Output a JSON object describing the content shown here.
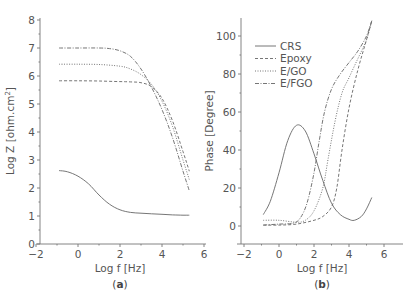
{
  "figure": {
    "panels": [
      {
        "id": "a",
        "label": "(a)",
        "bold_letter": "a"
      },
      {
        "id": "b",
        "label": "(b)",
        "bold_letter": "b"
      }
    ]
  },
  "chart_data": [
    {
      "type": "line",
      "panel": "(a)",
      "title": "",
      "xlabel": "Log f [Hz]",
      "ylabel": "Log Z [ohm.cm²]",
      "xlim": [
        -2,
        6
      ],
      "ylim": [
        0,
        8
      ],
      "xticks": [
        -2,
        0,
        2,
        4,
        6
      ],
      "yticks": [
        0,
        1,
        2,
        3,
        4,
        5,
        6,
        7,
        8
      ],
      "grid": false,
      "series": [
        {
          "name": "CRS",
          "style": "solid",
          "x": [
            -0.9,
            -0.5,
            0,
            0.5,
            1,
            1.5,
            2,
            2.5,
            3,
            3.5,
            4,
            4.5,
            5,
            5.3
          ],
          "y": [
            2.62,
            2.58,
            2.42,
            2.15,
            1.75,
            1.42,
            1.22,
            1.13,
            1.1,
            1.08,
            1.06,
            1.04,
            1.03,
            1.03
          ]
        },
        {
          "name": "Epoxy",
          "style": "dashed",
          "x": [
            -0.9,
            0,
            1,
            2,
            2.5,
            3,
            3.5,
            4,
            4.5,
            5,
            5.3
          ],
          "y": [
            5.83,
            5.83,
            5.82,
            5.8,
            5.79,
            5.76,
            5.62,
            5.2,
            4.4,
            3.3,
            2.6
          ]
        },
        {
          "name": "E/GO",
          "style": "dotted",
          "x": [
            -0.9,
            0,
            1,
            2,
            2.5,
            3,
            3.5,
            4,
            4.5,
            5,
            5.3
          ],
          "y": [
            6.42,
            6.42,
            6.41,
            6.35,
            6.25,
            6.05,
            5.7,
            5.1,
            4.2,
            3.0,
            2.3
          ]
        },
        {
          "name": "E/FGO",
          "style": "dash-dot",
          "x": [
            -0.9,
            0,
            1,
            1.5,
            2,
            2.5,
            3,
            3.5,
            4,
            4.5,
            5,
            5.3
          ],
          "y": [
            7.0,
            7.0,
            7.0,
            6.98,
            6.9,
            6.7,
            6.25,
            5.6,
            4.8,
            3.8,
            2.6,
            1.9
          ]
        }
      ]
    },
    {
      "type": "line",
      "panel": "(b)",
      "title": "",
      "xlabel": "Log f [Hz]",
      "ylabel": "Phase [Degree]",
      "xlim": [
        -2,
        7
      ],
      "ylim": [
        -10,
        110
      ],
      "xticks": [
        -2,
        0,
        2,
        4,
        6
      ],
      "yticks": [
        0,
        20,
        40,
        60,
        80,
        100
      ],
      "grid": false,
      "legend": {
        "position": "upper left",
        "entries": [
          "CRS",
          "Epoxy",
          "E/GO",
          "E/FGO"
        ]
      },
      "series": [
        {
          "name": "CRS",
          "style": "solid",
          "x": [
            -0.9,
            -0.5,
            0,
            0.5,
            1,
            1.5,
            2,
            2.5,
            3,
            3.5,
            4,
            4.3,
            4.7,
            5,
            5.3
          ],
          "y": [
            6,
            13,
            28,
            45,
            53,
            50,
            38,
            24,
            12,
            6,
            3.5,
            3,
            5,
            9,
            15
          ]
        },
        {
          "name": "Epoxy",
          "style": "dashed",
          "x": [
            -0.9,
            0,
            1,
            2,
            2.5,
            3,
            3.3,
            3.6,
            4,
            4.5,
            5,
            5.3
          ],
          "y": [
            0.5,
            0.5,
            1,
            3,
            5,
            10,
            20,
            40,
            62,
            82,
            98,
            108
          ]
        },
        {
          "name": "E/GO",
          "style": "dotted",
          "x": [
            -0.9,
            0,
            1,
            1.5,
            2,
            2.5,
            2.8,
            3.2,
            3.6,
            4,
            4.5,
            5,
            5.3
          ],
          "y": [
            3,
            3,
            2,
            3,
            8,
            20,
            35,
            55,
            70,
            78,
            88,
            98,
            108
          ]
        },
        {
          "name": "E/FGO",
          "style": "dash-dot",
          "x": [
            -0.9,
            0,
            0.8,
            1.2,
            1.6,
            2,
            2.3,
            2.6,
            3,
            3.5,
            4,
            4.5,
            5,
            5.3
          ],
          "y": [
            0.5,
            1,
            1.5,
            4,
            12,
            28,
            45,
            60,
            72,
            80,
            86,
            92,
            100,
            108
          ]
        }
      ]
    }
  ]
}
